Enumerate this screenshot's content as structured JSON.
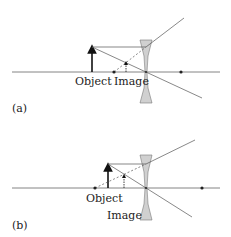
{
  "panels": [
    {
      "tag": "(a)",
      "object_label": "Object",
      "image_label": "Image"
    },
    {
      "tag": "(b)",
      "object_label": "Object",
      "image_label": "Image"
    }
  ],
  "colors": {
    "line": "#555555",
    "arrow": "#111111",
    "lens_fill": "#d0d0d0",
    "lens_stroke": "#777777"
  }
}
